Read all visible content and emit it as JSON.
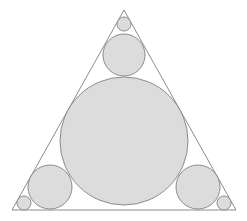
{
  "figure": {
    "colors": {
      "stroke": "#8c8c8c",
      "fill": "#dcdcdc",
      "background": "#ffffff"
    },
    "triangle": {
      "points": [
        [
          124,
          10
        ],
        [
          12,
          210
        ],
        [
          236,
          210
        ]
      ]
    },
    "circles": [
      {
        "id": "center-large",
        "cx": 124,
        "cy": 141,
        "r": 64
      },
      {
        "id": "top-medium",
        "cx": 124,
        "cy": 55,
        "r": 21
      },
      {
        "id": "top-small",
        "cx": 124,
        "cy": 24,
        "r": 7
      },
      {
        "id": "bottom-left-medium",
        "cx": 50,
        "cy": 187,
        "r": 22
      },
      {
        "id": "bottom-left-small",
        "cx": 24,
        "cy": 203,
        "r": 7
      },
      {
        "id": "bottom-right-medium",
        "cx": 198,
        "cy": 187,
        "r": 22
      },
      {
        "id": "bottom-right-small",
        "cx": 224,
        "cy": 203,
        "r": 7
      }
    ]
  }
}
